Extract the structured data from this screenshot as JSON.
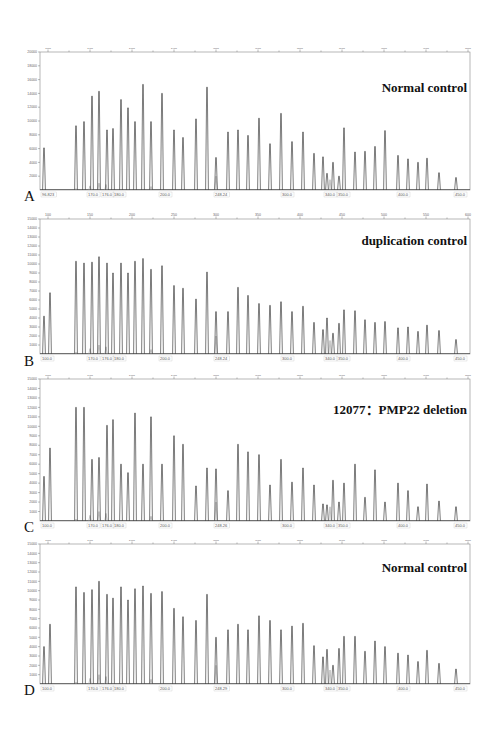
{
  "chart_data": [
    {
      "type": "line",
      "panel": "A",
      "title": "Normal control",
      "xlabel": "",
      "ylabel": "",
      "ylim": [
        0,
        20000
      ],
      "yticks": [
        2000,
        4000,
        6000,
        8000,
        10000,
        12000,
        14000,
        16000,
        18000,
        20000
      ],
      "top_ticks": [
        "100",
        "150",
        "200",
        "250",
        "300",
        "350",
        "400",
        "450",
        "500",
        "550",
        "600"
      ],
      "bottom_labels": [
        "96.823",
        "170.0",
        "176.0",
        "180.0",
        "200.0",
        "248.24",
        "300.0",
        "340.0",
        "350.0",
        "400.0",
        "450.0"
      ],
      "peaks_px": [
        44,
        76,
        84,
        92,
        99,
        107,
        113,
        121,
        128,
        135,
        143,
        151,
        162,
        174,
        183,
        196,
        207,
        216,
        228,
        238,
        248,
        259,
        270,
        281,
        292,
        303,
        314,
        323,
        327,
        333,
        339,
        344,
        355,
        365,
        375,
        385,
        398,
        408,
        418,
        427,
        439,
        456
      ],
      "values": [
        6100,
        9300,
        9900,
        13600,
        14300,
        8700,
        8900,
        13100,
        11900,
        9900,
        15300,
        9900,
        14000,
        8700,
        7600,
        10300,
        14900,
        4700,
        8400,
        8700,
        7900,
        10400,
        6700,
        11100,
        7000,
        8400,
        5300,
        4800,
        2400,
        4000,
        2000,
        9000,
        5500,
        5600,
        6300,
        8600,
        5000,
        4500,
        4000,
        4600,
        2500,
        1800
      ]
    },
    {
      "type": "line",
      "panel": "B",
      "title": "duplication control",
      "xlabel": "",
      "ylabel": "",
      "ylim": [
        0,
        15000
      ],
      "yticks": [
        1000,
        2000,
        3000,
        4000,
        5000,
        6000,
        7000,
        8000,
        9000,
        10000,
        11000,
        12000,
        13000,
        14000,
        15000
      ],
      "top_ticks": [
        "100",
        "150",
        "200",
        "250",
        "300",
        "350",
        "400",
        "450",
        "500",
        "550",
        "600"
      ],
      "bottom_labels": [
        "100.0",
        "170.0",
        "176.0",
        "180.0",
        "200.0",
        "248.24",
        "300.0",
        "340.0",
        "350.0",
        "400.0",
        "450.0"
      ],
      "peaks_px": [
        44,
        50,
        76,
        84,
        92,
        99,
        107,
        113,
        121,
        128,
        135,
        143,
        151,
        162,
        174,
        183,
        196,
        207,
        216,
        228,
        238,
        248,
        259,
        270,
        281,
        292,
        303,
        314,
        323,
        327,
        333,
        339,
        344,
        355,
        365,
        375,
        385,
        398,
        408,
        418,
        427,
        439,
        456
      ],
      "values": [
        4200,
        6800,
        10300,
        10100,
        10200,
        10800,
        10100,
        9000,
        10100,
        9000,
        10300,
        10600,
        9400,
        9800,
        7600,
        7300,
        6100,
        9100,
        4700,
        4700,
        7400,
        6500,
        5600,
        5400,
        5800,
        4700,
        5300,
        3500,
        2700,
        4000,
        2300,
        3400,
        4900,
        4800,
        3800,
        3500,
        3600,
        2900,
        3000,
        2500,
        3200,
        2600,
        1600
      ]
    },
    {
      "type": "line",
      "panel": "C",
      "title": "12077：PMP22 deletion",
      "xlabel": "",
      "ylabel": "",
      "ylim": [
        0,
        15000
      ],
      "yticks": [
        1000,
        2000,
        3000,
        4000,
        5000,
        6000,
        7000,
        8000,
        9000,
        10000,
        11000,
        12000,
        13000,
        14000,
        15000
      ],
      "top_ticks": [
        "100",
        "150",
        "200",
        "250",
        "300",
        "350",
        "400",
        "450",
        "500",
        "550",
        "600"
      ],
      "bottom_labels": [
        "100.0",
        "170.0",
        "176.0",
        "180.0",
        "200.0",
        "248.26",
        "300.0",
        "340.0",
        "350.0",
        "400.0",
        "450.0"
      ],
      "peaks_px": [
        44,
        50,
        76,
        84,
        92,
        99,
        107,
        113,
        121,
        128,
        135,
        143,
        151,
        162,
        174,
        183,
        196,
        207,
        216,
        228,
        238,
        248,
        259,
        270,
        281,
        292,
        303,
        314,
        323,
        327,
        333,
        339,
        344,
        355,
        365,
        375,
        385,
        398,
        408,
        418,
        427,
        439,
        456
      ],
      "values": [
        4700,
        7700,
        12000,
        12000,
        6500,
        6700,
        10100,
        10700,
        6000,
        5100,
        11400,
        6000,
        11000,
        6000,
        9000,
        8100,
        3700,
        5600,
        5500,
        3200,
        8100,
        7300,
        7000,
        3800,
        6500,
        4100,
        5600,
        3800,
        1800,
        1700,
        4300,
        2000,
        4000,
        6000,
        2500,
        5400,
        2000,
        4000,
        3200,
        1500,
        3900,
        2100,
        1500
      ]
    },
    {
      "type": "line",
      "panel": "D",
      "title": "Normal control",
      "xlabel": "",
      "ylabel": "",
      "ylim": [
        0,
        15000
      ],
      "yticks": [
        1000,
        2000,
        3000,
        4000,
        5000,
        6000,
        7000,
        8000,
        9000,
        10000,
        11000,
        12000,
        13000,
        14000,
        15000
      ],
      "top_ticks": [
        "100",
        "150",
        "200",
        "250",
        "300",
        "350",
        "400",
        "450",
        "500",
        "550",
        "600"
      ],
      "bottom_labels": [
        "100.0",
        "170.0",
        "176.0",
        "180.0",
        "200.0",
        "248.29",
        "300.0",
        "340.0",
        "350.0",
        "400.0",
        "450.0"
      ],
      "peaks_px": [
        44,
        50,
        76,
        84,
        92,
        99,
        107,
        113,
        121,
        128,
        135,
        143,
        151,
        162,
        174,
        183,
        196,
        207,
        216,
        228,
        238,
        248,
        259,
        270,
        281,
        292,
        303,
        314,
        323,
        327,
        333,
        339,
        344,
        355,
        365,
        375,
        385,
        398,
        408,
        418,
        427,
        439,
        456
      ],
      "values": [
        4000,
        6400,
        10400,
        9800,
        10100,
        11000,
        9600,
        9200,
        10400,
        9000,
        10200,
        10500,
        9700,
        9900,
        8100,
        7200,
        6800,
        9600,
        5000,
        5800,
        6400,
        5800,
        7300,
        6800,
        5800,
        6200,
        6500,
        4100,
        2900,
        3700,
        2000,
        3800,
        5100,
        5100,
        3500,
        4600,
        4000,
        3300,
        3100,
        2400,
        3600,
        2200,
        1600
      ]
    }
  ],
  "panels": [
    {
      "letter": "A",
      "title": "Normal control"
    },
    {
      "letter": "B",
      "title": "duplication control"
    },
    {
      "letter": "C",
      "title": "12077：PMP22 deletion"
    },
    {
      "letter": "D",
      "title": "Normal control"
    }
  ],
  "colors": {
    "trace": "#444444",
    "secondary_trace": "#9a9a9a",
    "axis": "#777777",
    "frame": "#888888"
  }
}
